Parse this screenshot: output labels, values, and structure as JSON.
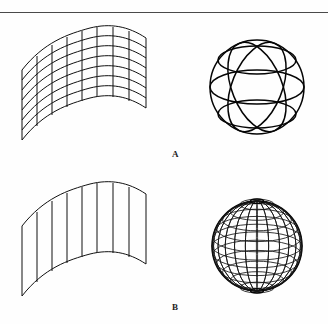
{
  "figure": {
    "background_color": "#fefefe",
    "line_color": "#111111",
    "rule": {
      "name": "top-rule",
      "y": 12,
      "width": 328,
      "color": "#4a4a4a"
    },
    "panels": [
      {
        "id": "panel-a-surface",
        "name": "coarse-wavy-surface",
        "kind": "parametric-surface",
        "description": "Wavy bicubic patch drawn as a coarse quad mesh",
        "u_lines": 9,
        "v_lines": 8,
        "shows_isoparametric_curves": "both"
      },
      {
        "id": "panel-a-sphere",
        "name": "coarse-wireframe-sphere",
        "kind": "sphere",
        "description": "Sphere rendered with a very small number of meridians and parallels",
        "meridians": 2,
        "parallels": 3,
        "silhouette": 1
      },
      {
        "id": "panel-b-surface",
        "name": "ruled-wavy-surface",
        "kind": "parametric-surface",
        "description": "Same wavy patch drawn with only the vertical isoparametric lines",
        "u_lines": 9,
        "v_lines": 0,
        "shows_isoparametric_curves": "u-only"
      },
      {
        "id": "panel-b-sphere",
        "name": "fine-wireframe-sphere",
        "kind": "sphere",
        "description": "Sphere rendered with a dense set of meridians and parallels",
        "meridians": 12,
        "parallels": 11,
        "silhouette": 1
      }
    ],
    "labels": {
      "a": "A",
      "b": "B"
    }
  }
}
